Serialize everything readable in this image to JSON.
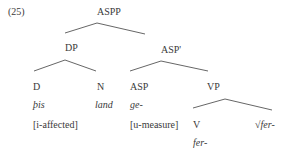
{
  "example_number": "(25)",
  "tree": {
    "aspp": "ASPP",
    "dp": "DP",
    "asp_bar": "ASP'",
    "d": "D",
    "d_word": "þis",
    "d_feature": "[i-affected]",
    "n": "N",
    "n_word": "land",
    "asp": "ASP",
    "asp_word": "ge-",
    "asp_feature": "[u-measure]",
    "vp": "VP",
    "v": "V",
    "v_word": "fer-",
    "root": "√fer-"
  },
  "colors": {
    "text": "#3a3a3a",
    "lines": "#555555",
    "background": "#ffffff"
  }
}
